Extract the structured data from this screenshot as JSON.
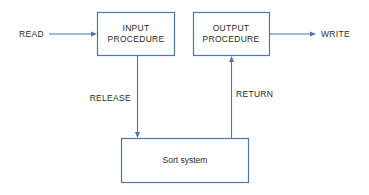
{
  "diagram": {
    "nodes": {
      "input_procedure": {
        "line1": "INPUT",
        "line2": "PROCEDURE"
      },
      "output_procedure": {
        "line1": "OUTPUT",
        "line2": "PROCEDURE"
      },
      "sort_system": {
        "label": "Sort system"
      }
    },
    "edges": {
      "read": {
        "label": "READ",
        "from": "external",
        "to": "input_procedure"
      },
      "release": {
        "label": "RELEASE",
        "from": "input_procedure",
        "to": "sort_system"
      },
      "return": {
        "label": "RETURN",
        "from": "sort_system",
        "to": "output_procedure"
      },
      "write": {
        "label": "WRITE",
        "from": "output_procedure",
        "to": "external"
      }
    },
    "colors": {
      "stroke": "#4f74a8",
      "text": "#2a2a2a"
    }
  }
}
